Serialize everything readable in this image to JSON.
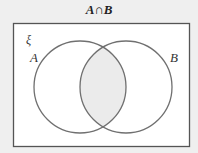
{
  "diagram": {
    "title": "A∩B",
    "universal_label": "ξ",
    "sets": [
      {
        "name": "A",
        "label": "A",
        "cx": 80,
        "cy": 87,
        "r": 46
      },
      {
        "name": "B",
        "label": "B",
        "cx": 126,
        "cy": 87,
        "r": 46
      }
    ],
    "shaded_region": "A∩B",
    "colors": {
      "background": "#efefef",
      "universe_fill": "#ffffff",
      "stroke": "#666666",
      "shade": "#ebebeb"
    }
  }
}
